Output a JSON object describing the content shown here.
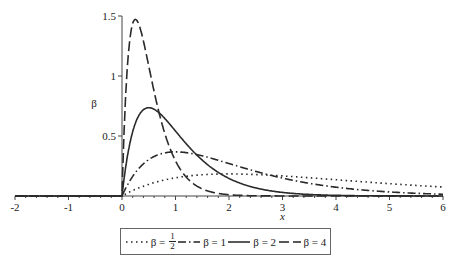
{
  "chart_data": {
    "type": "line",
    "title": "",
    "xlabel": "x",
    "ylabel": "β",
    "xlim": [
      -2,
      6
    ],
    "ylim": [
      0,
      1.5
    ],
    "x_ticks": [
      "-2",
      "-1",
      "0",
      "1",
      "2",
      "3",
      "4",
      "5",
      "6"
    ],
    "y_ticks": [
      "0.5",
      "1",
      "1.5"
    ],
    "grid": false,
    "legend_position": "bottom",
    "function": "f(x) = β² x e^(-βx) for x ≥ 0, 0 for x < 0",
    "x": [
      -2,
      -1,
      0,
      0.25,
      0.5,
      1,
      1.5,
      2,
      3,
      4,
      5,
      6
    ],
    "series": [
      {
        "name": "β = 1/2",
        "beta": 0.5,
        "style": "dotted",
        "values": [
          0,
          0,
          0,
          0.055,
          0.097,
          0.152,
          0.177,
          0.184,
          0.167,
          0.135,
          0.103,
          0.075
        ]
      },
      {
        "name": "β = 1",
        "beta": 1,
        "style": "dashdot",
        "values": [
          0,
          0,
          0,
          0.195,
          0.303,
          0.368,
          0.335,
          0.271,
          0.149,
          0.073,
          0.034,
          0.015
        ]
      },
      {
        "name": "β = 2",
        "beta": 2,
        "style": "solid",
        "values": [
          0,
          0,
          0,
          0.607,
          0.736,
          0.541,
          0.299,
          0.147,
          0.03,
          0.005,
          0.001,
          0.0
        ]
      },
      {
        "name": "β = 4",
        "beta": 4,
        "style": "dashed",
        "values": [
          0,
          0,
          0,
          1.472,
          1.083,
          0.293,
          0.059,
          0.011,
          0.0,
          0.0,
          0.0,
          0.0
        ]
      }
    ]
  },
  "legend": {
    "items": [
      {
        "prefix": "β =",
        "num": "1",
        "den": "2"
      },
      {
        "label": "β = 1"
      },
      {
        "label": "β = 2"
      },
      {
        "label": "β = 4"
      }
    ]
  },
  "axes": {
    "xlabel": "x",
    "ylabel": "β"
  }
}
